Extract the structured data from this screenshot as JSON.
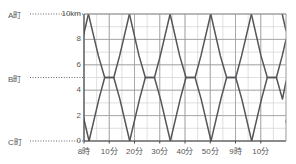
{
  "chart_data": {
    "type": "line",
    "title": "",
    "xlabel": "",
    "ylabel": "",
    "ylim": [
      0,
      10
    ],
    "xlim": [
      0,
      80
    ],
    "grid": true,
    "legend": null,
    "y_unit": "km",
    "x_unit": "分",
    "y_tick_values": [
      0,
      2,
      4,
      6,
      8,
      10
    ],
    "y_tick_labels": [
      "0",
      "2",
      "4",
      "6",
      "8",
      "10km"
    ],
    "x_tick_values": [
      0,
      10,
      20,
      30,
      40,
      50,
      60,
      70
    ],
    "x_tick_labels": [
      "8時",
      "10分",
      "20分",
      "30分",
      "40分",
      "50分",
      "9時",
      "10分"
    ],
    "y_minor_step": 1,
    "x_minor_step": 5,
    "reference_lines": [
      {
        "label": "A町",
        "value": 10,
        "style": "dotted"
      },
      {
        "label": "B町",
        "value": 5,
        "style": "dotted"
      },
      {
        "label": "C町",
        "value": 0,
        "style": "dotted"
      }
    ],
    "series": [
      {
        "name": "up-1",
        "points": [
          [
            -9,
            0
          ],
          [
            0,
            8.5
          ],
          [
            1.76,
            10
          ]
        ]
      },
      {
        "name": "down-1",
        "points": [
          [
            -10.6,
            10
          ],
          [
            0,
            1.7
          ],
          [
            2,
            0
          ]
        ]
      },
      {
        "name": "up-2",
        "points": [
          [
            2,
            0
          ],
          [
            5.9,
            3.3
          ],
          [
            8.2,
            5
          ],
          [
            11.8,
            5
          ],
          [
            14.1,
            6.7
          ],
          [
            18,
            10
          ]
        ]
      },
      {
        "name": "down-2",
        "points": [
          [
            1.76,
            10
          ],
          [
            5.7,
            6.7
          ],
          [
            8.2,
            5
          ],
          [
            11.8,
            5
          ],
          [
            14.2,
            3.3
          ],
          [
            18.1,
            0
          ]
        ]
      },
      {
        "name": "up-3",
        "points": [
          [
            18.1,
            0
          ],
          [
            22,
            3.3
          ],
          [
            24.3,
            5
          ],
          [
            27.9,
            5
          ],
          [
            30.2,
            6.7
          ],
          [
            34.1,
            10
          ]
        ]
      },
      {
        "name": "down-3",
        "points": [
          [
            18,
            10
          ],
          [
            21.8,
            6.7
          ],
          [
            24.3,
            5
          ],
          [
            27.9,
            5
          ],
          [
            30.3,
            3.3
          ],
          [
            34.2,
            0
          ]
        ]
      },
      {
        "name": "up-4",
        "points": [
          [
            34.2,
            0
          ],
          [
            38.1,
            3.3
          ],
          [
            40.4,
            5
          ],
          [
            44,
            5
          ],
          [
            46.3,
            6.7
          ],
          [
            50.2,
            10
          ]
        ]
      },
      {
        "name": "down-4",
        "points": [
          [
            34.1,
            10
          ],
          [
            37.9,
            6.7
          ],
          [
            40.4,
            5
          ],
          [
            44,
            5
          ],
          [
            46.4,
            3.3
          ],
          [
            50.3,
            0
          ]
        ]
      },
      {
        "name": "up-5",
        "points": [
          [
            50.3,
            0
          ],
          [
            54.2,
            3.3
          ],
          [
            56.5,
            5
          ],
          [
            60.1,
            5
          ],
          [
            62.4,
            6.7
          ],
          [
            66.3,
            10
          ]
        ]
      },
      {
        "name": "down-5",
        "points": [
          [
            50.2,
            10
          ],
          [
            54,
            6.7
          ],
          [
            56.5,
            5
          ],
          [
            60.1,
            5
          ],
          [
            62.5,
            3.3
          ],
          [
            66.4,
            0
          ]
        ]
      },
      {
        "name": "up-6",
        "points": [
          [
            66.4,
            0
          ],
          [
            70.3,
            3.3
          ],
          [
            72.6,
            5
          ],
          [
            76.2,
            5
          ],
          [
            78.5,
            6.7
          ],
          [
            80,
            8
          ]
        ]
      },
      {
        "name": "down-6",
        "points": [
          [
            66.3,
            10
          ],
          [
            70.1,
            6.7
          ],
          [
            72.6,
            5
          ],
          [
            76.2,
            5
          ],
          [
            78.6,
            3.3
          ],
          [
            80,
            4.7
          ]
        ]
      },
      {
        "name": "up-7",
        "points": [
          [
            80,
            1.5
          ],
          [
            82.3,
            3.3
          ]
        ]
      },
      {
        "name": "edge-top-right",
        "points": [
          [
            78.5,
            10
          ],
          [
            80,
            8.7
          ]
        ]
      }
    ]
  },
  "axis": {
    "y_label_a": "A町",
    "y_label_b": "B町",
    "y_label_c": "C町"
  },
  "colors": {
    "line": "#55555a",
    "grid_major": "#9a9a9a",
    "grid_minor": "#d2d2d2",
    "axis": "#4a4a4a",
    "text": "#555555",
    "background": "#ffffff"
  }
}
